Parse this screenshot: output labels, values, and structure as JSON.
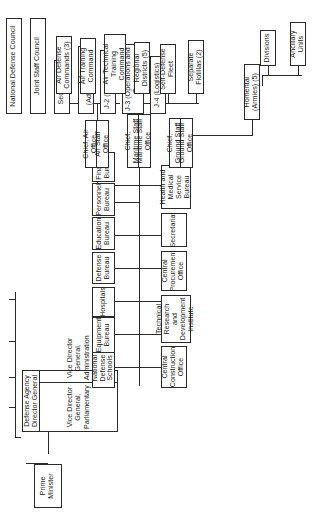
{
  "chart": {
    "orientation": "rotated-90-counterclockwise",
    "nodes": {
      "prime_minister": "Prime Minister",
      "national_defense_council": "National Defense Council",
      "joint_staff_council": "Joint Staff Council",
      "joint_secretariat": "Secretariat",
      "j1": "J-1 (Administration)",
      "j2": "J-2 (Intelligence)",
      "j3": "J-3 (Operations and Training)",
      "j4": "J-4 (Logistics)",
      "dg_title": "Defense Agency Director General",
      "vice_dg_parliamentary": "Vice Director General, Parliamentary",
      "vice_dg_administration": "Vice Director General, Administration",
      "agency_secretariat": "Secretariat",
      "finance_bureau": "Finance Bureau",
      "personnel_bureau": "Personnel Bureau",
      "education_bureau": "Education Bureau",
      "defense_bureau": "Defense Bureau",
      "equipment_bureau": "Equipment Bureau",
      "health_medical_bureau": "Health and Medical Service Bureau",
      "central_procurement_office": "Central Procurement Office",
      "technical_research_institute": "Technical Research and Development Institute",
      "central_construction_office": "Central Construction Office",
      "hospitals": "Hospitals",
      "national_defense_schools": "National Defense Schools",
      "chief_ground_staff": "Chief, Ground Staff",
      "ground_staff_office": "Ground Staff Office",
      "homentai": "Homentai (Armies) (5)",
      "divisions": "Divisions",
      "ancillary_units": "Ancillary Units",
      "chief_maritime_staff": "Chief, Maritime Staff",
      "maritime_staff_office": "Maritime Staff Office",
      "regional_districts": "Regional Districts (5)",
      "self_defense_fleet": "Self-Defense Fleet",
      "separate_flotillas": "Separate Flotillas (2)",
      "chief_air_office": "Chief, Air Office",
      "air_staff_office": "Air Staff Office",
      "air_defense_commands": "Air Defense Commands (3)",
      "air_training_command": "Air Training Command",
      "air_technical_training_command": "Air Technical Training Command"
    }
  }
}
